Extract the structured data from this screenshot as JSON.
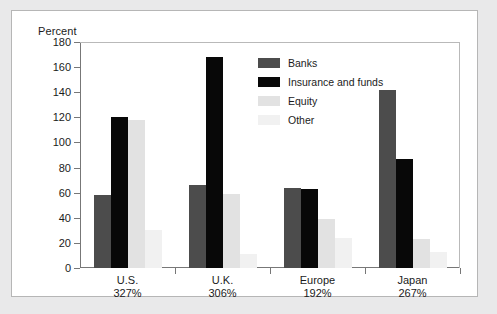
{
  "chart_data": {
    "type": "bar",
    "title": "",
    "subtitle": "",
    "xlabel": "",
    "ylabel": "Percent",
    "ylim": [
      0,
      180
    ],
    "yticks": [
      0,
      20,
      40,
      60,
      80,
      100,
      120,
      140,
      160,
      180
    ],
    "grid": false,
    "legend_position": "top-center-inside",
    "categories": [
      "U.S.",
      "U.K.",
      "Europe",
      "Japan"
    ],
    "category_sublabels": [
      "327%",
      "306%",
      "192%",
      "267%"
    ],
    "series": [
      {
        "name": "Banks",
        "color": "#4c4c4c",
        "values": [
          58,
          66,
          64,
          142
        ]
      },
      {
        "name": "Insurance and funds",
        "color": "#080808",
        "values": [
          120,
          168,
          63,
          87
        ]
      },
      {
        "name": "Equity",
        "color": "#e2e2e2",
        "values": [
          118,
          59,
          39,
          23
        ]
      },
      {
        "name": "Other",
        "color": "#f1f1f1",
        "values": [
          30,
          11,
          24,
          13
        ]
      }
    ]
  },
  "axis": {
    "y_title": "Percent",
    "tick_labels": [
      "180",
      "160",
      "140",
      "120",
      "100",
      "80",
      "60",
      "40",
      "20",
      "0"
    ]
  },
  "legend": {
    "items": [
      {
        "label": "Banks",
        "key": "banks"
      },
      {
        "label": "Insurance and funds",
        "key": "insurance"
      },
      {
        "label": "Equity",
        "key": "equity"
      },
      {
        "label": "Other",
        "key": "other"
      }
    ]
  },
  "categories": [
    {
      "name": "U.S.",
      "pct": "327%"
    },
    {
      "name": "U.K.",
      "pct": "306%"
    },
    {
      "name": "Europe",
      "pct": "192%"
    },
    {
      "name": "Japan",
      "pct": "267%"
    }
  ]
}
